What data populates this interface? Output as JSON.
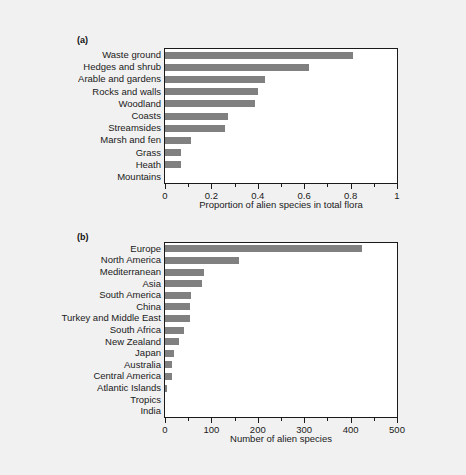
{
  "figure": {
    "background_color": "#f1f1f1",
    "bar_color": "#808080",
    "axis_color": "#1a1a1a",
    "plot_background_color": "#ffffff"
  },
  "panels": [
    {
      "label": "(a)",
      "label_name": "panel-label-a"
    },
    {
      "label": "(b)",
      "label_name": "panel-label-b"
    }
  ],
  "chart_data": [
    {
      "type": "bar",
      "orientation": "horizontal",
      "panel": "(a)",
      "title": "",
      "xlabel": "Proportion of alien species in total flora",
      "ylabel": "",
      "xlim": [
        0,
        1
      ],
      "xticks": [
        0,
        0.2,
        0.4,
        0.6,
        0.8,
        1
      ],
      "xticklabels": [
        "0",
        "0.2",
        "0.4",
        "0.6",
        "0.8",
        "1"
      ],
      "xminorticks": [
        0.1,
        0.3,
        0.5,
        0.7,
        0.9
      ],
      "grid": false,
      "legend": "none",
      "bar_color": "#808080",
      "categories": [
        "Waste ground",
        "Hedges and shrub",
        "Arable and gardens",
        "Rocks and walls",
        "Woodland",
        "Coasts",
        "Streamsides",
        "Marsh and fen",
        "Grass",
        "Heath",
        "Mountains"
      ],
      "values": [
        0.81,
        0.62,
        0.43,
        0.4,
        0.39,
        0.27,
        0.26,
        0.11,
        0.07,
        0.07,
        0.0
      ]
    },
    {
      "type": "bar",
      "orientation": "horizontal",
      "panel": "(b)",
      "title": "",
      "xlabel": "Number of alien species",
      "ylabel": "",
      "xlim": [
        0,
        500
      ],
      "xticks": [
        0,
        100,
        200,
        300,
        400,
        500
      ],
      "xticklabels": [
        "0",
        "100",
        "200",
        "300",
        "400",
        "500"
      ],
      "xminorticks": [
        50,
        150,
        250,
        350,
        450
      ],
      "grid": false,
      "legend": "none",
      "bar_color": "#808080",
      "categories": [
        "Europe",
        "North America",
        "Mediterranean",
        "Asia",
        "South America",
        "China",
        "Turkey and Middle East",
        "South Africa",
        "New Zealand",
        "Japan",
        "Australia",
        "Central America",
        "Atlantic Islands",
        "Tropics",
        "India"
      ],
      "values": [
        425,
        160,
        85,
        80,
        57,
        53,
        53,
        42,
        30,
        20,
        16,
        15,
        4,
        0,
        0
      ]
    }
  ]
}
